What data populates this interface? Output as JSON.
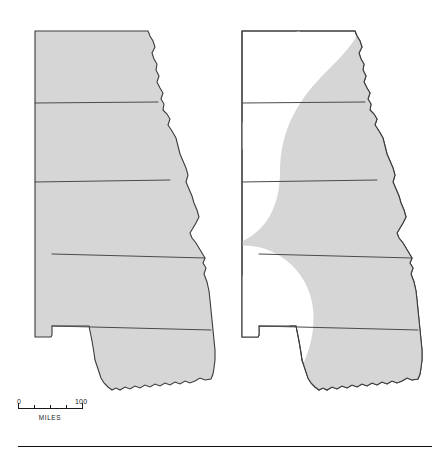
{
  "figure": {
    "background_color": "#ffffff"
  },
  "maps": [
    {
      "id": "map-left",
      "label": "Left map",
      "shaded_fill": "#d6d6d6",
      "unshaded_fill": "#ffffff",
      "outline_color": "#3a3a3a",
      "state_outline_color": "#4a4a4a",
      "states": [
        "North Dakota",
        "South Dakota",
        "Nebraska",
        "Kansas",
        "Oklahoma"
      ],
      "shaded_states": [
        "North Dakota",
        "South Dakota",
        "Nebraska",
        "Kansas",
        "Oklahoma"
      ]
    },
    {
      "id": "map-right",
      "label": "Right map",
      "shaded_fill": "#d6d6d6",
      "unshaded_fill": "#ffffff",
      "outline_color": "#3a3a3a",
      "state_outline_color": "#4a4a4a",
      "states": [
        "North Dakota",
        "South Dakota",
        "Nebraska",
        "Kansas",
        "Oklahoma"
      ],
      "unshaded_region": "western crescent spanning western North Dakota, western South Dakota, the Nebraska panhandle, western Kansas and the Oklahoma panhandle"
    }
  ],
  "scale_bar": {
    "name": "distance-scale",
    "min_label": "0",
    "max_label": "100",
    "units": "MILES",
    "tick_count": 5,
    "length_px": 64
  },
  "footer": {
    "rule_color": "#111111"
  }
}
